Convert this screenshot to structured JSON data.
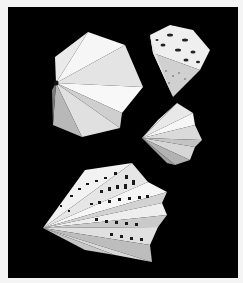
{
  "image": {
    "subject": "Four white folded paper sculptures on black background",
    "colors": {
      "frame": "#f4f4f4",
      "background": "#000000",
      "paper_light": "#f2f2f2",
      "paper_mid": "#d8d8d8",
      "paper_shadow": "#9a9a9a",
      "paper_dark": "#6e6e6e"
    },
    "objects": [
      {
        "name": "folded-heptagon-sculpture",
        "position": "top-left"
      },
      {
        "name": "perforated-cube-sculpture",
        "position": "top-right"
      },
      {
        "name": "small-folded-fan-sculpture",
        "position": "middle-right"
      },
      {
        "name": "perforated-fan-sculpture",
        "position": "bottom-left"
      }
    ]
  }
}
